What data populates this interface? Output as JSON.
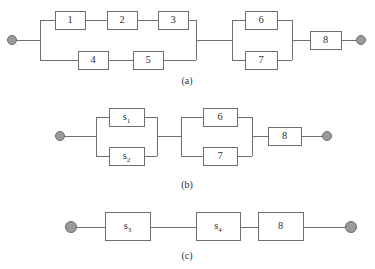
{
  "figure": {
    "width": 375,
    "height": 269,
    "background": "#ffffff",
    "line_color": "#6f6f6f",
    "node_fill": "#9a9a9a",
    "node_stroke": "#6a6a6a",
    "text_color": "#2f2f2f"
  },
  "panels": [
    {
      "id": "a",
      "caption": "(a)",
      "blocks": [
        {
          "key": "b1",
          "label": "1",
          "sub": ""
        },
        {
          "key": "b2",
          "label": "2",
          "sub": ""
        },
        {
          "key": "b3",
          "label": "3",
          "sub": ""
        },
        {
          "key": "b4",
          "label": "4",
          "sub": ""
        },
        {
          "key": "b5",
          "label": "5",
          "sub": ""
        },
        {
          "key": "b6",
          "label": "6",
          "sub": ""
        },
        {
          "key": "b7",
          "label": "7",
          "sub": ""
        },
        {
          "key": "b8",
          "label": "8",
          "sub": ""
        }
      ],
      "terminals": [
        "source",
        "sink"
      ]
    },
    {
      "id": "b",
      "caption": "(b)",
      "blocks": [
        {
          "key": "bs1",
          "label": "s",
          "sub": "1"
        },
        {
          "key": "bs2",
          "label": "s",
          "sub": "2"
        },
        {
          "key": "b6",
          "label": "6",
          "sub": ""
        },
        {
          "key": "b7",
          "label": "7",
          "sub": ""
        },
        {
          "key": "b8",
          "label": "8",
          "sub": ""
        }
      ],
      "terminals": [
        "source",
        "sink"
      ]
    },
    {
      "id": "c",
      "caption": "(c)",
      "blocks": [
        {
          "key": "bs3",
          "label": "s",
          "sub": "3"
        },
        {
          "key": "bs4",
          "label": "s",
          "sub": "4"
        },
        {
          "key": "b8",
          "label": "8",
          "sub": ""
        }
      ],
      "terminals": [
        "source",
        "sink"
      ]
    }
  ],
  "captions": {
    "a": "(a)",
    "b": "(b)",
    "c": "(c)"
  },
  "labels": {
    "one": "1",
    "two": "2",
    "three": "3",
    "four": "4",
    "five": "5",
    "six": "6",
    "seven": "7",
    "eight": "8",
    "s": "s",
    "sub1": "1",
    "sub2": "2",
    "sub3": "3",
    "sub4": "4"
  }
}
